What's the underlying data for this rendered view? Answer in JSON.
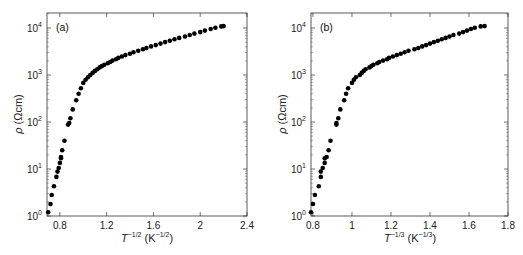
{
  "chart_data": [
    {
      "type": "scatter",
      "panel_label": "(a)",
      "title": "",
      "xlabel": "T^-1/2 (K^-1/2)",
      "xlabel_parts": {
        "base": "T",
        "exp": "-1/2",
        "unit_open": " (K",
        "unit_exp": "-1/2",
        "unit_close": ")"
      },
      "ylabel": "ρ (Ωcm)",
      "yscale": "log",
      "xlim": [
        0.69,
        2.4
      ],
      "ylim": [
        1,
        20000
      ],
      "xticks": [
        "0.8",
        "1.2",
        "1.6",
        "2",
        "2.4"
      ],
      "xtick_values": [
        0.8,
        1.2,
        1.6,
        2.0,
        2.4
      ],
      "yticks": [
        "10^0",
        "10^1",
        "10^2",
        "10^3",
        "10^4"
      ],
      "ytick_values": [
        1,
        10,
        100,
        1000,
        10000
      ],
      "grid": false,
      "legend": null,
      "series": [
        {
          "name": "rho",
          "marker": "filled-circle",
          "x": [
            0.7,
            0.72,
            0.73,
            0.75,
            0.77,
            0.78,
            0.79,
            0.8,
            0.81,
            0.81,
            0.82,
            0.84,
            0.87,
            0.88,
            0.89,
            0.91,
            0.94,
            0.96,
            0.98,
            1.0,
            1.02,
            1.04,
            1.06,
            1.08,
            1.1,
            1.12,
            1.14,
            1.16,
            1.18,
            1.21,
            1.23,
            1.25,
            1.28,
            1.3,
            1.33,
            1.36,
            1.4,
            1.43,
            1.47,
            1.51,
            1.54,
            1.58,
            1.62,
            1.66,
            1.7,
            1.74,
            1.78,
            1.82,
            1.87,
            1.91,
            1.95,
            2.0,
            2.04,
            2.09,
            2.13,
            2.18,
            2.2
          ],
          "y": [
            1.2,
            1.8,
            2.8,
            4.3,
            6.8,
            8.8,
            10.5,
            13.5,
            17,
            18,
            25,
            40,
            88,
            95,
            120,
            185,
            290,
            400,
            520,
            680,
            790,
            900,
            1000,
            1110,
            1220,
            1330,
            1450,
            1550,
            1650,
            1770,
            1890,
            2020,
            2160,
            2310,
            2480,
            2650,
            2840,
            3060,
            3280,
            3520,
            3760,
            4050,
            4320,
            4650,
            5000,
            5350,
            5750,
            6150,
            6600,
            7100,
            7600,
            8200,
            8800,
            9500,
            10100,
            10800,
            11000
          ]
        }
      ]
    },
    {
      "type": "scatter",
      "panel_label": "(b)",
      "title": "",
      "xlabel": "T^-1/3 (K^-1/3)",
      "xlabel_parts": {
        "base": "T",
        "exp": "-1/3",
        "unit_open": " (K",
        "unit_exp": "-1/3",
        "unit_close": ")"
      },
      "ylabel": "ρ (Ωcm)",
      "yscale": "log",
      "xlim": [
        0.79,
        1.8
      ],
      "ylim": [
        1,
        20000
      ],
      "xticks": [
        "0.8",
        "1",
        "1.2",
        "1.4",
        "1.6",
        "1.8"
      ],
      "xtick_values": [
        0.8,
        1.0,
        1.2,
        1.4,
        1.6,
        1.8
      ],
      "yticks": [
        "10^0",
        "10^1",
        "10^2",
        "10^3",
        "10^4"
      ],
      "ytick_values": [
        1,
        10,
        100,
        1000,
        10000
      ],
      "grid": false,
      "legend": null,
      "series": [
        {
          "name": "rho",
          "marker": "filled-circle",
          "x": [
            0.79,
            0.8,
            0.81,
            0.83,
            0.84,
            0.84,
            0.85,
            0.86,
            0.86,
            0.87,
            0.88,
            0.89,
            0.92,
            0.92,
            0.93,
            0.94,
            0.96,
            0.97,
            0.98,
            1.0,
            1.01,
            1.02,
            1.04,
            1.05,
            1.06,
            1.07,
            1.09,
            1.1,
            1.11,
            1.13,
            1.14,
            1.16,
            1.18,
            1.19,
            1.21,
            1.23,
            1.25,
            1.27,
            1.29,
            1.32,
            1.34,
            1.36,
            1.38,
            1.4,
            1.42,
            1.44,
            1.46,
            1.48,
            1.5,
            1.52,
            1.55,
            1.57,
            1.59,
            1.61,
            1.63,
            1.66,
            1.68,
            1.7
          ],
          "y": [
            1.2,
            1.8,
            2.8,
            4.3,
            6.8,
            8.8,
            10.5,
            13.5,
            17,
            18,
            25,
            40,
            88,
            95,
            120,
            185,
            290,
            400,
            520,
            680,
            790,
            900,
            1000,
            1110,
            1220,
            1330,
            1450,
            1550,
            1650,
            1770,
            1890,
            2020,
            2160,
            2310,
            2480,
            2650,
            2840,
            3060,
            3280,
            3520,
            3760,
            4050,
            4320,
            4650,
            5000,
            5350,
            5750,
            6150,
            6600,
            7100,
            7600,
            8200,
            8800,
            9500,
            10100,
            10800,
            11000
          ]
        }
      ]
    }
  ],
  "panels": {
    "a": {
      "label": "(a)",
      "ylabel_symbol": "ρ",
      "ylabel_unit": " (Ωcm)",
      "xlabel_base": "T",
      "xlabel_exp": "−1/2",
      "xlabel_unit_open": " (K",
      "xlabel_unit_exp": "−1/2",
      "xlabel_unit_close": ")",
      "xticks": [
        "0.8",
        "1.2",
        "1.6",
        "2",
        "2.4"
      ],
      "ytick_base": "10",
      "ytick_exps": [
        "0",
        "1",
        "2",
        "3",
        "4"
      ]
    },
    "b": {
      "label": "(b)",
      "ylabel_symbol": "ρ",
      "ylabel_unit": " (Ωcm)",
      "xlabel_base": "T",
      "xlabel_exp": "−1/3",
      "xlabel_unit_open": " (K",
      "xlabel_unit_exp": "−1/3",
      "xlabel_unit_close": ")",
      "xticks": [
        "0.8",
        "1",
        "1.2",
        "1.4",
        "1.6",
        "1.8"
      ],
      "ytick_base": "10",
      "ytick_exps": [
        "0",
        "1",
        "2",
        "3",
        "4"
      ]
    }
  }
}
